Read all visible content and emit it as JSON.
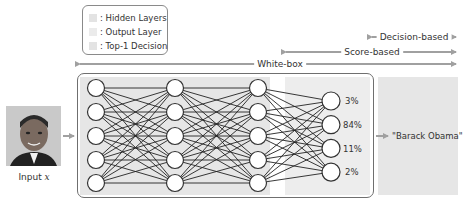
{
  "legend": {
    "items": [
      {
        "label": ": Hidden Layers",
        "swatch_color": "#e3e3e3"
      },
      {
        "label": ": Output Layer",
        "swatch_color": "#ebebeb"
      },
      {
        "label": ": Top-1 Decision",
        "swatch_color": "#e6e6e6"
      }
    ]
  },
  "access_levels": {
    "white_box": "White-box",
    "score_based": "Score-based",
    "decision_based": "Decision-based"
  },
  "input": {
    "label_prefix": "Input ",
    "label_var": "x",
    "image_desc": "face-photo"
  },
  "network": {
    "layers": [
      5,
      5,
      5,
      4
    ],
    "output_scores": [
      "3%",
      "84%",
      "11%",
      "2%"
    ]
  },
  "decision": {
    "label": "\"Barack Obama\""
  },
  "colors": {
    "shade": "#e6e6e6",
    "arrow": "#a0a0a0",
    "box_border": "#6f6f6f",
    "node_stroke": "#333333",
    "edge": "#222222"
  }
}
